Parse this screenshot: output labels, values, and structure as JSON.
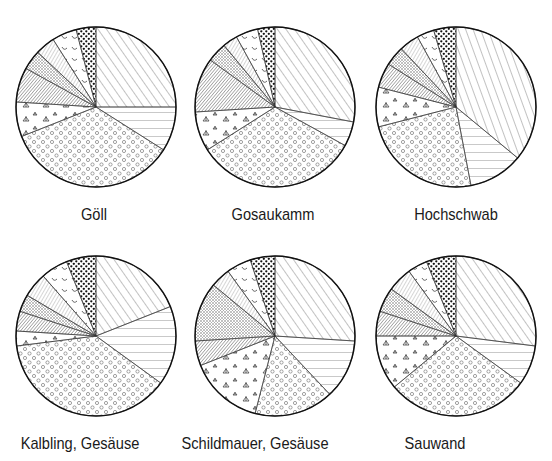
{
  "chart_data": [
    {
      "type": "pie",
      "title": "Göll",
      "center": [
        96,
        107
      ],
      "radius": 80,
      "slices": [
        {
          "pattern": "diag-fwd",
          "percent": 25.0
        },
        {
          "pattern": "horizontal",
          "percent": 9.0
        },
        {
          "pattern": "circles",
          "percent": 35.0
        },
        {
          "pattern": "grass",
          "percent": 7.0
        },
        {
          "pattern": "dense-diag",
          "percent": 7.0
        },
        {
          "pattern": "crosshatch",
          "percent": 4.0
        },
        {
          "pattern": "diag-back",
          "percent": 4.0
        },
        {
          "pattern": "arcs",
          "percent": 5.0
        },
        {
          "pattern": "dots-bold",
          "percent": 4.0
        }
      ]
    },
    {
      "type": "pie",
      "title": "Gosaukamm",
      "center": [
        275,
        107
      ],
      "radius": 80,
      "slices": [
        {
          "pattern": "diag-fwd",
          "percent": 28.0
        },
        {
          "pattern": "horizontal",
          "percent": 5.0
        },
        {
          "pattern": "circles",
          "percent": 33.0
        },
        {
          "pattern": "grass",
          "percent": 8.0
        },
        {
          "pattern": "dense-diag",
          "percent": 11.0
        },
        {
          "pattern": "crosshatch",
          "percent": 4.0
        },
        {
          "pattern": "diag-back",
          "percent": 3.0
        },
        {
          "pattern": "arcs",
          "percent": 4.5
        },
        {
          "pattern": "dots-bold",
          "percent": 3.5
        }
      ]
    },
    {
      "type": "pie",
      "title": "Hochschwab",
      "center": [
        456,
        107
      ],
      "radius": 80,
      "slices": [
        {
          "pattern": "diag-steep",
          "percent": 36.0
        },
        {
          "pattern": "horizontal",
          "percent": 11.0
        },
        {
          "pattern": "circles",
          "percent": 24.0
        },
        {
          "pattern": "grass",
          "percent": 8.0
        },
        {
          "pattern": "dense-diag",
          "percent": 5.0
        },
        {
          "pattern": "crosshatch",
          "percent": 4.0
        },
        {
          "pattern": "diag-back",
          "percent": 4.0
        },
        {
          "pattern": "arcs",
          "percent": 3.5
        },
        {
          "pattern": "dots-bold",
          "percent": 4.5
        }
      ]
    },
    {
      "type": "pie",
      "title": "Kalbling, Gesäuse",
      "center": [
        96,
        336
      ],
      "radius": 80,
      "slices": [
        {
          "pattern": "diag-fwd",
          "percent": 19.0
        },
        {
          "pattern": "horizontal",
          "percent": 16.0
        },
        {
          "pattern": "circles",
          "percent": 38.0
        },
        {
          "pattern": "grass",
          "percent": 3.0
        },
        {
          "pattern": "dense-diag",
          "percent": 4.0
        },
        {
          "pattern": "crosshatch",
          "percent": 3.5
        },
        {
          "pattern": "diag-back",
          "percent": 5.0
        },
        {
          "pattern": "arcs",
          "percent": 5.5
        },
        {
          "pattern": "dots-bold",
          "percent": 6.0
        }
      ]
    },
    {
      "type": "pie",
      "title": "Schildmauer, Gesäuse",
      "center": [
        275,
        336
      ],
      "radius": 80,
      "slices": [
        {
          "pattern": "diag-fwd",
          "percent": 26.0
        },
        {
          "pattern": "horizontal",
          "percent": 12.0
        },
        {
          "pattern": "circles",
          "percent": 16.0
        },
        {
          "pattern": "grass",
          "percent": 15.0
        },
        {
          "pattern": "dense-diag",
          "percent": 5.0
        },
        {
          "pattern": "crosshatch",
          "percent": 12.0
        },
        {
          "pattern": "diag-back",
          "percent": 4.0
        },
        {
          "pattern": "arcs",
          "percent": 5.0
        },
        {
          "pattern": "dots-bold",
          "percent": 5.0
        }
      ]
    },
    {
      "type": "pie",
      "title": "Sauwand",
      "center": [
        456,
        336
      ],
      "radius": 80,
      "slices": [
        {
          "pattern": "diag-fwd",
          "percent": 27.0
        },
        {
          "pattern": "horizontal",
          "percent": 8.0
        },
        {
          "pattern": "circles",
          "percent": 29.0
        },
        {
          "pattern": "grass",
          "percent": 11.0
        },
        {
          "pattern": "dense-diag",
          "percent": 5.0
        },
        {
          "pattern": "crosshatch",
          "percent": 5.0
        },
        {
          "pattern": "diag-back",
          "percent": 5.0
        },
        {
          "pattern": "arcs",
          "percent": 4.0
        },
        {
          "pattern": "dots-bold",
          "percent": 6.0
        }
      ]
    }
  ],
  "labels": {
    "goll": "Göll",
    "gosaukamm": "Gosaukamm",
    "hochschwab": "Hochschwab",
    "kalbling": "Kalbling, Gesäuse",
    "schildmauer": "Schildmauer, Gesäuse",
    "sauwand": "Sauwand"
  }
}
